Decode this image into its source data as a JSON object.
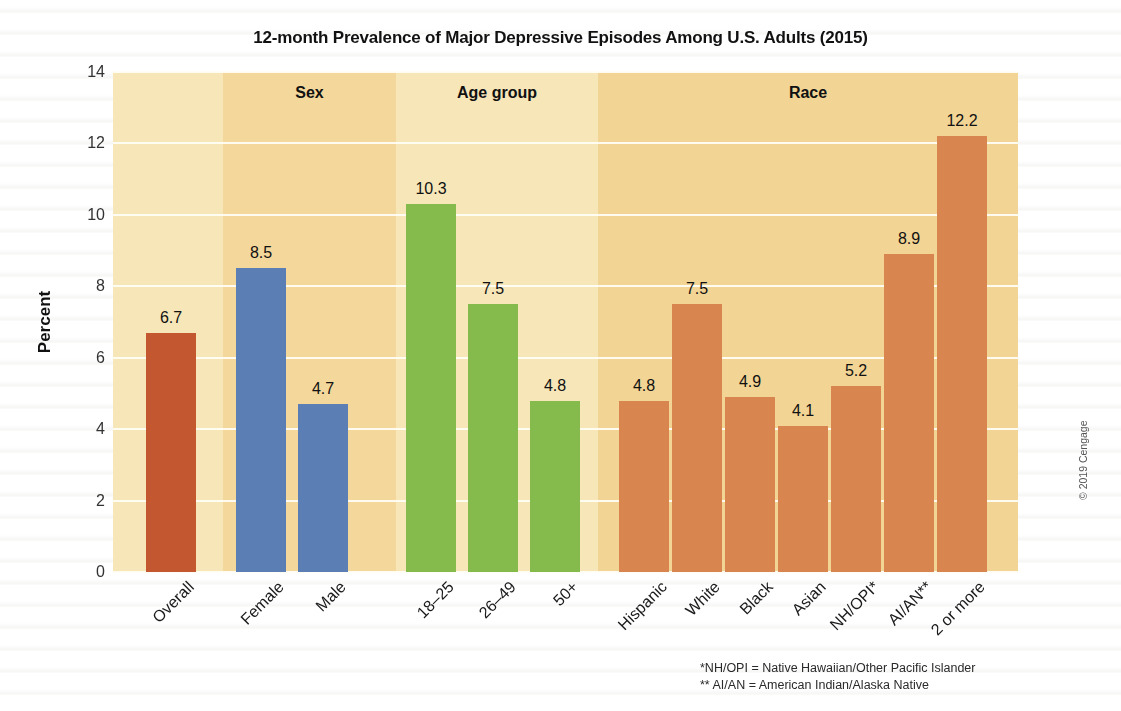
{
  "chart_data": {
    "type": "bar",
    "title": "12-month Prevalence of Major Depressive Episodes Among U.S. Adults (2015)",
    "xlabel": "",
    "ylabel": "Percent",
    "ylim": [
      0,
      14
    ],
    "yticks": [
      "0",
      "2",
      "4",
      "6",
      "8",
      "10",
      "12",
      "14"
    ],
    "grid": true,
    "legend": "none",
    "categories": [
      "Overall",
      "Female",
      "Male",
      "18–25",
      "26–49",
      "50+",
      "Hispanic",
      "White",
      "Black",
      "Asian",
      "NH/OPI*",
      "AI/AN**",
      "2 or more"
    ],
    "values": [
      6.7,
      8.5,
      4.7,
      10.3,
      7.5,
      4.8,
      4.8,
      7.5,
      4.9,
      4.1,
      5.2,
      8.9,
      12.2
    ],
    "value_labels": [
      "6.7",
      "8.5",
      "4.7",
      "10.3",
      "7.5",
      "4.8",
      "4.8",
      "7.5",
      "4.9",
      "4.1",
      "5.2",
      "8.9",
      "12.2"
    ],
    "bar_colors": [
      "#c3572f",
      "#5b7fb4",
      "#5b7fb4",
      "#85bb4c",
      "#85bb4c",
      "#85bb4c",
      "#d8854f",
      "#d8854f",
      "#d8854f",
      "#d8854f",
      "#d8854f",
      "#d8854f",
      "#d8854f"
    ],
    "groups": [
      {
        "label": "",
        "key": "overall",
        "start": 0,
        "count": 1,
        "band_color": "#f6e6b8"
      },
      {
        "label": "Sex",
        "key": "sex",
        "start": 1,
        "count": 2,
        "band_color": "#f4d79a"
      },
      {
        "label": "Age group",
        "key": "age",
        "start": 3,
        "count": 3,
        "band_color": "#f6e6b8"
      },
      {
        "label": "Race",
        "key": "race",
        "start": 6,
        "count": 7,
        "band_color": "#f2d494"
      }
    ],
    "annotations": [
      "*NH/OPI = Native Hawaiian/Other Pacific Islander",
      "** AI/AN = American Indian/Alaska Native"
    ],
    "credit": "© 2019 Cengage"
  },
  "colors": {
    "bar_overall": "#c3572f",
    "bar_sex": "#5b7fb4",
    "bar_age": "#85bb4c",
    "bar_race": "#d8854f",
    "band_light": "#f6e6b8",
    "band_dark": "#f2d494",
    "gridline": "#fffdf4",
    "text": "#1a1a1a"
  }
}
